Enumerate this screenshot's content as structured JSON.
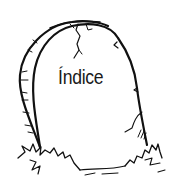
{
  "illustration": {
    "subject": "tombstone",
    "label": "Índice",
    "stroke_color": "#111111",
    "background": "#ffffff"
  }
}
